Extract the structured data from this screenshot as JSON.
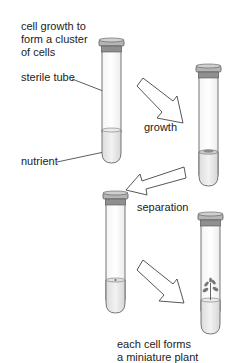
{
  "diagram": {
    "labels": {
      "intro": [
        "cell growth to",
        "form a cluster",
        "of cells"
      ],
      "sterile_tube": "sterile tube",
      "nutrient": "nutrient",
      "growth": "growth",
      "separation": "separation",
      "result": [
        "each cell forms",
        "a miniature plant"
      ]
    },
    "stages": [
      {
        "id": "tube-1",
        "content": "nutrient"
      },
      {
        "id": "tube-2",
        "content": "cell cluster on nutrient"
      },
      {
        "id": "tube-3",
        "content": "single cell on nutrient"
      },
      {
        "id": "tube-4",
        "content": "miniature plant on nutrient"
      }
    ],
    "arrows": [
      {
        "from": "tube-1",
        "to": "tube-2",
        "label": "growth"
      },
      {
        "from": "tube-2",
        "to": "tube-3",
        "label": "separation"
      },
      {
        "from": "tube-3",
        "to": "tube-4",
        "label": ""
      }
    ],
    "colors": {
      "outline": "#444444",
      "cap": "#9a9a9a",
      "nutrient": "#e6e6e6",
      "plant": "#666666"
    }
  }
}
